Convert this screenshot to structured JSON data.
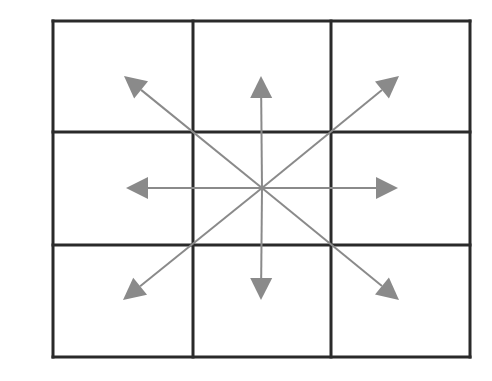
{
  "diagram": {
    "type": "grid-with-directional-arrows",
    "grid": {
      "rows": 3,
      "cols": 3,
      "x": [
        53,
        193,
        331,
        470
      ],
      "y": [
        21,
        132,
        245,
        357
      ],
      "line_color": "#2a2a2a",
      "line_width": 3
    },
    "center": [
      262,
      188
    ],
    "arrow_color": "#8a8a8a",
    "arrows": [
      {
        "name": "arrow-up-left",
        "tip": [
          124,
          76
        ]
      },
      {
        "name": "arrow-up",
        "tip": [
          261,
          76
        ]
      },
      {
        "name": "arrow-up-right",
        "tip": [
          399,
          76
        ]
      },
      {
        "name": "arrow-left",
        "tip": [
          126,
          188
        ]
      },
      {
        "name": "arrow-right",
        "tip": [
          398,
          188
        ]
      },
      {
        "name": "arrow-down-left",
        "tip": [
          123,
          300
        ]
      },
      {
        "name": "arrow-down",
        "tip": [
          261,
          300
        ]
      },
      {
        "name": "arrow-down-right",
        "tip": [
          399,
          300
        ]
      }
    ]
  }
}
